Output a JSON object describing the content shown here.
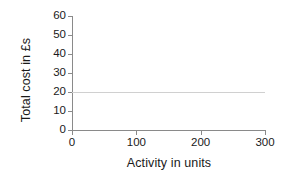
{
  "chart_data": {
    "type": "line",
    "title": "",
    "subtitle": "",
    "xlabel": "Activity in units",
    "ylabel": "Total cost in £s",
    "xlim": [
      0,
      300
    ],
    "ylim": [
      0,
      60
    ],
    "x_ticks": [
      "0",
      "100",
      "200",
      "300"
    ],
    "x_tick_values": [
      0,
      100,
      200,
      300
    ],
    "y_ticks": [
      "0",
      "10",
      "20",
      "30",
      "40",
      "50",
      "60"
    ],
    "y_tick_values": [
      0,
      10,
      20,
      30,
      40,
      50,
      60
    ],
    "grid": false,
    "legend": "none",
    "series": [
      {
        "name": "Fixed cost",
        "color": "#d0d0d0",
        "x": [
          0,
          300
        ],
        "values": [
          20,
          20
        ]
      }
    ]
  },
  "axes": {
    "y_title": "Total cost in £s",
    "x_title": "Activity in units",
    "axis_color": "#8a8a8a"
  },
  "y_tick_labels": [
    {
      "text": "60",
      "value": 60
    },
    {
      "text": "50",
      "value": 50
    },
    {
      "text": "40",
      "value": 40
    },
    {
      "text": "30",
      "value": 30
    },
    {
      "text": "20",
      "value": 20
    },
    {
      "text": "10",
      "value": 10
    },
    {
      "text": "0",
      "value": 0
    }
  ],
  "x_tick_labels": [
    {
      "text": "0",
      "value": 0
    },
    {
      "text": "100",
      "value": 100
    },
    {
      "text": "200",
      "value": 200
    },
    {
      "text": "300",
      "value": 300
    }
  ]
}
